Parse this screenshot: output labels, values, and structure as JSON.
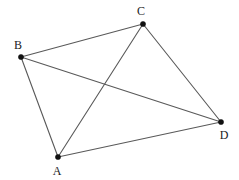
{
  "figure": {
    "background_color": "#ffffff",
    "line_color": "#595959",
    "vertex_color": "#111111",
    "label_color": "#1a1a1a",
    "width": 239,
    "height": 180
  },
  "vertices": [
    {
      "id": "A",
      "label": "A",
      "x": 58,
      "y": 157,
      "label_x": 57,
      "label_y": 171,
      "dot_r": 2.6
    },
    {
      "id": "B",
      "label": "B",
      "x": 21,
      "y": 57,
      "label_x": 18,
      "label_y": 45,
      "dot_r": 2.6
    },
    {
      "id": "C",
      "label": "C",
      "x": 143,
      "y": 24,
      "label_x": 141,
      "label_y": 11,
      "dot_r": 2.6
    },
    {
      "id": "D",
      "label": "D",
      "x": 221,
      "y": 122,
      "label_x": 224,
      "label_y": 135,
      "dot_r": 2.6
    }
  ],
  "edges": [
    {
      "id": "edge-bc",
      "from": "B",
      "to": "C",
      "x1": 21,
      "y1": 57,
      "x2": 143,
      "y2": 24
    },
    {
      "id": "edge-ba",
      "from": "B",
      "to": "A",
      "x1": 21,
      "y1": 57,
      "x2": 58,
      "y2": 157
    },
    {
      "id": "edge-bd",
      "from": "B",
      "to": "D",
      "x1": 21,
      "y1": 57,
      "x2": 221,
      "y2": 122
    },
    {
      "id": "edge-ac",
      "from": "A",
      "to": "C",
      "x1": 58,
      "y1": 157,
      "x2": 143,
      "y2": 24
    },
    {
      "id": "edge-ad",
      "from": "A",
      "to": "D",
      "x1": 58,
      "y1": 157,
      "x2": 221,
      "y2": 122
    },
    {
      "id": "edge-cd",
      "from": "C",
      "to": "D",
      "x1": 143,
      "y1": 24,
      "x2": 221,
      "y2": 122
    }
  ]
}
